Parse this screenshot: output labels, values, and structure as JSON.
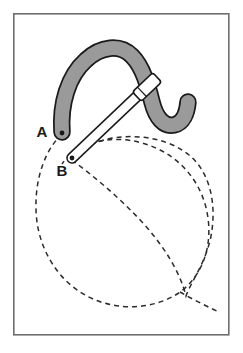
{
  "figure": {
    "type": "line-drawing",
    "background_color": "#ffffff",
    "frame": {
      "name": "figure-border",
      "x": 13,
      "y": 13,
      "width": 216,
      "height": 322,
      "stroke_color": "#6e6e6e",
      "stroke_width": 1.6,
      "fill": "none"
    },
    "labels": [
      {
        "id": "A",
        "text": "A",
        "x": 42,
        "y": 137,
        "anchor_point_x": 62,
        "anchor_point_y": 133
      },
      {
        "id": "B",
        "text": "B",
        "x": 59,
        "y": 176,
        "anchor_point_x": 72,
        "anchor_point_y": 159
      }
    ],
    "shapes": {
      "gray_band": {
        "name": "curved-gray-band",
        "description": "thick gray curved track shaped like a cursive n with a hook tail",
        "fill_color": "#9a9a9a",
        "stroke_color": "#1a1a1a",
        "stroke_width": 1.8,
        "band_width": 13
      },
      "rod": {
        "name": "white-linkage-rod",
        "description": "long slender white bar with rounded ends from B to upper right",
        "fill_color": "#ffffff",
        "stroke_color": "#1a1a1a",
        "stroke_width": 1.6,
        "start_x": 72,
        "start_y": 158,
        "end_x": 152,
        "end_y": 82,
        "thickness": 9
      },
      "slider_clip": {
        "name": "slider-clip",
        "description": "small rectangular collar near the top end of the rod",
        "fill_color": "#ffffff",
        "stroke_color": "#1a1a1a"
      },
      "pivot_a": {
        "name": "pivot-point-a",
        "x": 62,
        "y": 133,
        "radius": 2.4,
        "color": "#1a1a1a"
      },
      "pivot_b": {
        "name": "pivot-point-b",
        "x": 72,
        "y": 158,
        "radius": 2.4,
        "color": "#1a1a1a"
      }
    },
    "dashed_curves": {
      "name": "traced-loci",
      "stroke_color": "#2b2b2b",
      "stroke_width": 1.5,
      "dash_pattern": "5 4",
      "curve_count": 2,
      "curves": [
        {
          "id": "locus-from-a",
          "origin_label": "A",
          "description": "large dashed closed loop starting at A sweeping down and right"
        },
        {
          "id": "locus-from-b",
          "origin_label": "B",
          "description": "large dashed loop starting at B sweeping right and down, crossing the first"
        }
      ],
      "intersection_x": 180,
      "intersection_y": 292,
      "tail_end_x": 219,
      "tail_end_y": 312
    }
  }
}
